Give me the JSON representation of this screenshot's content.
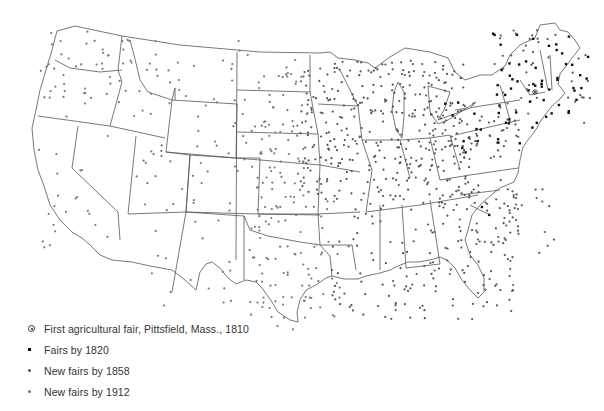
{
  "map": {
    "subject": "Agricultural fairs in the United States",
    "region": "Contiguous United States",
    "first_fair_marker": {
      "label": "Pittsfield, Mass.",
      "year": 1810
    }
  },
  "legend": {
    "items": [
      {
        "symbol": "circled-dot",
        "label": "First agricultural fair, Pittsfield, Mass., 1810"
      },
      {
        "symbol": "square-dot-black",
        "label": "Fairs by 1820"
      },
      {
        "symbol": "dot-dark-gray",
        "label": "New fairs by 1858"
      },
      {
        "symbol": "dot-gray",
        "label": "New fairs by 1912"
      }
    ]
  },
  "colors": {
    "background": "#ffffff",
    "outline": "#555555",
    "fairs_1820": "#111111",
    "fairs_1858": "#555555",
    "fairs_1912": "#777777",
    "text": "#333333"
  },
  "density_regions": [
    {
      "name": "new-england",
      "box": [
        490,
        30,
        590,
        130
      ],
      "count": 95,
      "era": "1820",
      "mix": 0.55
    },
    {
      "name": "mid-atlantic",
      "box": [
        430,
        100,
        520,
        160
      ],
      "count": 80,
      "era": "1858",
      "mix": 0.2
    },
    {
      "name": "midwest",
      "box": [
        300,
        60,
        470,
        200
      ],
      "count": 330,
      "era": "1858",
      "mix": 0.0
    },
    {
      "name": "plains",
      "box": [
        250,
        60,
        310,
        230
      ],
      "count": 90,
      "era": "1912",
      "mix": 0.0
    },
    {
      "name": "south",
      "box": [
        330,
        190,
        520,
        320
      ],
      "count": 170,
      "era": "1858",
      "mix": 0.0
    },
    {
      "name": "southeast-coast",
      "box": [
        470,
        180,
        560,
        260
      ],
      "count": 40,
      "era": "1858",
      "mix": 0.05
    },
    {
      "name": "texas-oklahoma",
      "box": [
        250,
        200,
        340,
        330
      ],
      "count": 80,
      "era": "1912",
      "mix": 0.0
    },
    {
      "name": "mountain",
      "box": [
        130,
        40,
        250,
        220
      ],
      "count": 70,
      "era": "1912",
      "mix": 0.0
    },
    {
      "name": "southwest",
      "box": [
        150,
        220,
        250,
        310
      ],
      "count": 18,
      "era": "1912",
      "mix": 0.0
    },
    {
      "name": "pacific-nw",
      "box": [
        40,
        30,
        130,
        110
      ],
      "count": 45,
      "era": "1912",
      "mix": 0.0
    },
    {
      "name": "california",
      "box": [
        35,
        110,
        110,
        260
      ],
      "count": 22,
      "era": "1912",
      "mix": 0.0
    }
  ]
}
